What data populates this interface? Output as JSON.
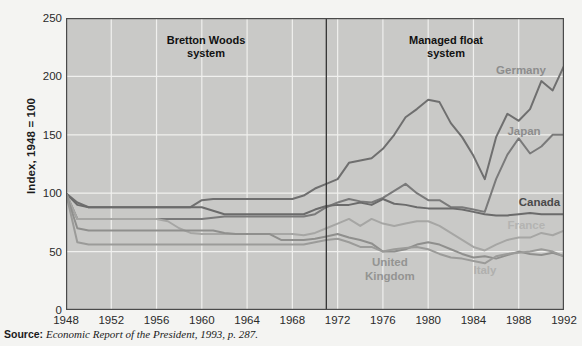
{
  "figure": {
    "background": "#f4f4f2",
    "plot_background": "#c9c9c7",
    "grid_color": "#f0f0ee",
    "axis_color": "#4a4a4a"
  },
  "source": {
    "label": "Source:",
    "text": "Economic Report of the President, 1993, p. 287."
  },
  "annotations": {
    "era1": "Bretton Woods\nsystem",
    "era2": "Managed float\nsystem",
    "divider_year": 1971
  },
  "chart_data": {
    "type": "line",
    "title": "",
    "subtitle": "",
    "xlabel": "",
    "ylabel": "Index, 1948 = 100",
    "xlim": [
      1948,
      1992
    ],
    "ylim": [
      0,
      250
    ],
    "yticks": [
      0,
      50,
      100,
      150,
      200,
      250
    ],
    "xticks": [
      1948,
      1952,
      1956,
      1960,
      1964,
      1968,
      1972,
      1976,
      1980,
      1984,
      1988,
      1992
    ],
    "grid": true,
    "legend_position": "inline-labels",
    "x": [
      1948,
      1949,
      1950,
      1951,
      1952,
      1953,
      1954,
      1955,
      1956,
      1957,
      1958,
      1959,
      1960,
      1961,
      1962,
      1963,
      1964,
      1965,
      1966,
      1967,
      1968,
      1969,
      1970,
      1971,
      1972,
      1973,
      1974,
      1975,
      1976,
      1977,
      1978,
      1979,
      1980,
      1981,
      1982,
      1983,
      1984,
      1985,
      1986,
      1987,
      1988,
      1989,
      1990,
      1991,
      1992
    ],
    "series": [
      {
        "name": "Germany",
        "color": "#6f6f6f",
        "label_color": "#8d8d8d",
        "label_x": 1986,
        "label_y": 205,
        "values": [
          100,
          92,
          88,
          88,
          88,
          88,
          88,
          88,
          88,
          88,
          88,
          88,
          94,
          95,
          95,
          95,
          95,
          95,
          95,
          95,
          95,
          98,
          104,
          108,
          112,
          126,
          128,
          130,
          138,
          150,
          165,
          172,
          180,
          178,
          160,
          148,
          132,
          112,
          148,
          168,
          162,
          172,
          196,
          188,
          209
        ]
      },
      {
        "name": "Japan",
        "color": "#7a7a7a",
        "label_color": "#8d8d8d",
        "label_x": 1987,
        "label_y": 152,
        "values": [
          100,
          78,
          78,
          78,
          78,
          78,
          78,
          78,
          78,
          78,
          78,
          78,
          78,
          79,
          80,
          80,
          80,
          80,
          80,
          80,
          80,
          80,
          82,
          88,
          92,
          95,
          93,
          92,
          96,
          102,
          108,
          100,
          94,
          94,
          88,
          88,
          86,
          84,
          112,
          133,
          147,
          134,
          140,
          150,
          150
        ]
      },
      {
        "name": "Canada",
        "color": "#6b6b6b",
        "label_color": "#4a4a4a",
        "label_x": 1988,
        "label_y": 92,
        "values": [
          100,
          90,
          88,
          88,
          88,
          88,
          88,
          88,
          88,
          88,
          88,
          88,
          88,
          85,
          82,
          82,
          82,
          82,
          82,
          82,
          82,
          82,
          86,
          89,
          90,
          90,
          92,
          90,
          95,
          91,
          90,
          88,
          87,
          87,
          87,
          86,
          84,
          82,
          81,
          81,
          82,
          83,
          82,
          82,
          82
        ]
      },
      {
        "name": "France",
        "color": "#a6a6a4",
        "label_color": "#b4b4b2",
        "label_x": 1987,
        "label_y": 72,
        "values": [
          100,
          78,
          78,
          78,
          78,
          78,
          78,
          78,
          78,
          76,
          70,
          66,
          65,
          65,
          65,
          65,
          65,
          65,
          65,
          65,
          65,
          64,
          66,
          70,
          74,
          78,
          72,
          78,
          74,
          72,
          74,
          76,
          76,
          72,
          66,
          60,
          54,
          51,
          56,
          60,
          62,
          62,
          66,
          64,
          68
        ]
      },
      {
        "name": "United Kingdom",
        "color": "#8f8f8d",
        "label_color": "#949492",
        "label_x": 1976,
        "label_y": 40,
        "values": [
          100,
          70,
          68,
          68,
          68,
          68,
          68,
          68,
          68,
          68,
          68,
          68,
          68,
          68,
          66,
          65,
          65,
          65,
          65,
          60,
          60,
          60,
          61,
          63,
          65,
          62,
          60,
          57,
          50,
          50,
          52,
          56,
          58,
          56,
          52,
          48,
          45,
          46,
          44,
          47,
          50,
          48,
          47,
          49,
          46
        ]
      },
      {
        "name": "Italy",
        "color": "#9b9b99",
        "label_color": "#b0b0ae",
        "label_x": 1984,
        "label_y": 33,
        "values": [
          100,
          58,
          56,
          56,
          56,
          56,
          56,
          56,
          56,
          56,
          56,
          56,
          56,
          56,
          56,
          56,
          56,
          56,
          56,
          56,
          56,
          56,
          58,
          60,
          61,
          58,
          54,
          54,
          50,
          52,
          53,
          54,
          52,
          48,
          45,
          44,
          42,
          40,
          46,
          48,
          49,
          50,
          52,
          50,
          46
        ]
      }
    ]
  }
}
